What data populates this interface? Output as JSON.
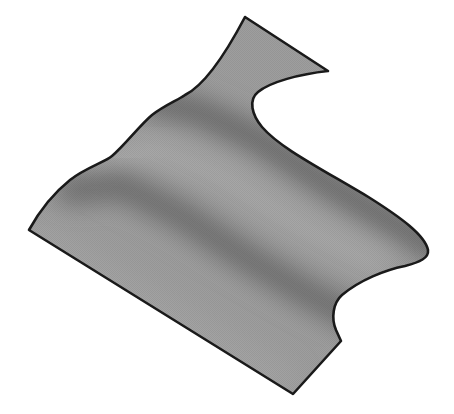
{
  "figure": {
    "colors": {
      "background": "#ffffff",
      "surface_base": "#9c9c9c",
      "surface_light": "#a8a8a8",
      "surface_dark": "#6a6a6a",
      "outline": "#1a1a1a"
    }
  }
}
